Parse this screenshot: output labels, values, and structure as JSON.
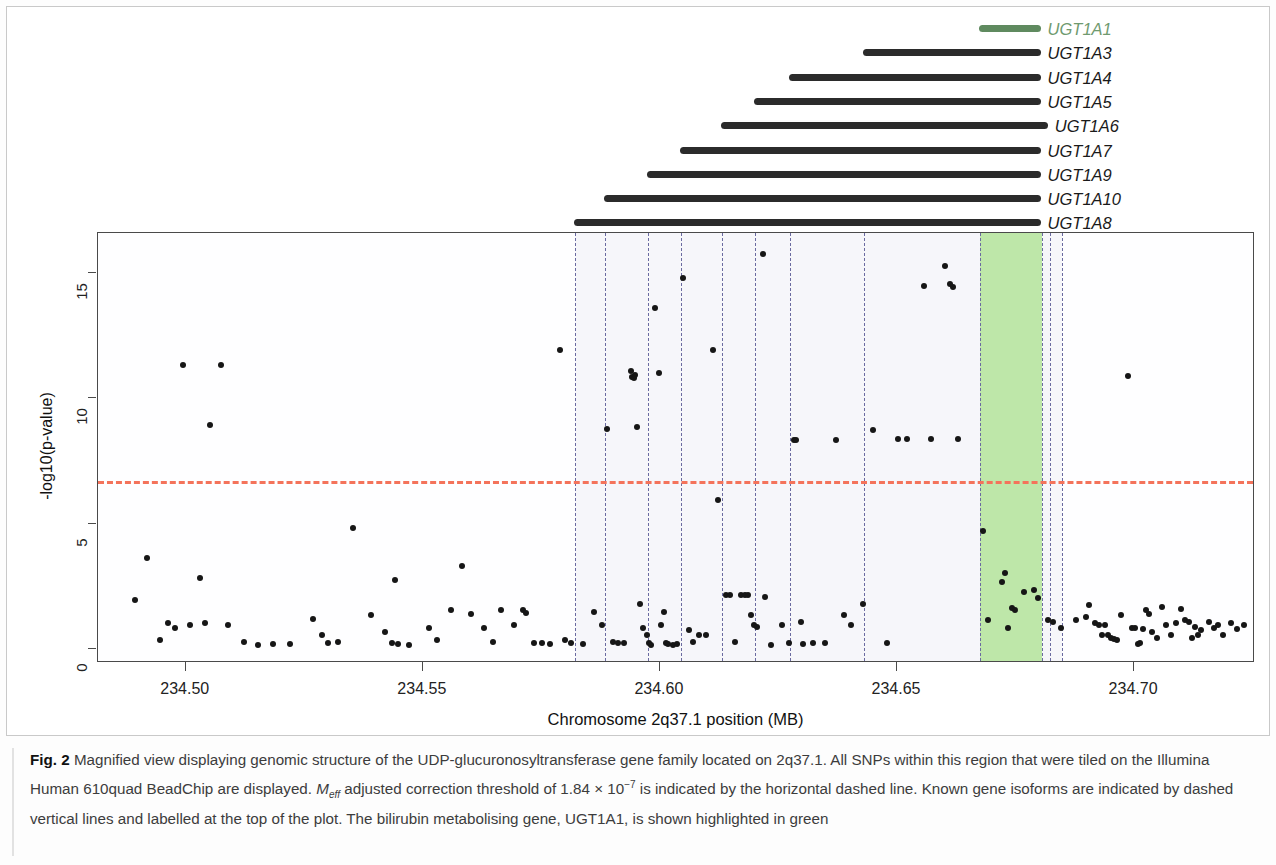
{
  "figure": {
    "label": "Fig. 2",
    "caption_part1": " Magnified view displaying genomic structure of the UDP-glucuronosyltransferase gene family located on 2q37.1. All SNPs within this region that were tiled on the Illumina Human 610quad BeadChip are displayed. ",
    "meff_italic": "M",
    "meff_sub": "eff",
    "caption_part2": " adjusted correction threshold of 1.84 × 10",
    "threshold_exp": "−7",
    "caption_part3": " is indicated by the horizontal dashed line. Known gene isoforms are indicated by dashed vertical lines and labelled at the top of the plot. The bilirubin metabolising gene, UGT1A1, is shown highlighted in green"
  },
  "genes": [
    {
      "name": "UGT1A1",
      "start": 234.6675,
      "end": 234.6805,
      "color": "#5f8a5f",
      "highlight": true
    },
    {
      "name": "UGT1A3",
      "start": 234.643,
      "end": 234.6805,
      "color": "#2b2b2b",
      "highlight": false
    },
    {
      "name": "UGT1A4",
      "start": 234.6275,
      "end": 234.6805,
      "color": "#2b2b2b",
      "highlight": false
    },
    {
      "name": "UGT1A5",
      "start": 234.62,
      "end": 234.6805,
      "color": "#2b2b2b",
      "highlight": false
    },
    {
      "name": "UGT1A6",
      "start": 234.613,
      "end": 234.682,
      "color": "#2b2b2b",
      "highlight": false
    },
    {
      "name": "UGT1A7",
      "start": 234.6045,
      "end": 234.6805,
      "color": "#2b2b2b",
      "highlight": false
    },
    {
      "name": "UGT1A9",
      "start": 234.5975,
      "end": 234.6805,
      "color": "#2b2b2b",
      "highlight": false
    },
    {
      "name": "UGT1A10",
      "start": 234.5885,
      "end": 234.6805,
      "color": "#2b2b2b",
      "highlight": false
    },
    {
      "name": "UGT1A8",
      "start": 234.582,
      "end": 234.6805,
      "color": "#2b2b2b",
      "highlight": false
    }
  ],
  "chart_data": {
    "type": "scatter",
    "title": "",
    "xlabel": "Chromosome 2q37.1 position (MB)",
    "ylabel": "-log10(p-value)",
    "xlim": [
      234.4815,
      234.7255
    ],
    "ylim": [
      -0.55,
      16.6
    ],
    "xticks": [
      234.5,
      234.55,
      234.6,
      234.65,
      234.7
    ],
    "xticklabels": [
      "234.50",
      "234.55",
      "234.60",
      "234.65",
      "234.70"
    ],
    "yticks": [
      0,
      5,
      10,
      15
    ],
    "yticklabels": [
      "0",
      "5",
      "10",
      "15"
    ],
    "grid": false,
    "legend": "none",
    "threshold_line": {
      "y": 6.7,
      "color": "#f4735b",
      "style": "dashed",
      "label": "Meff adjusted correction threshold 1.84e-7"
    },
    "gene_boundary_lines": {
      "color": "#6a6aa0",
      "style": "dashed",
      "x": [
        234.582,
        234.5885,
        234.5975,
        234.6045,
        234.613,
        234.62,
        234.6275,
        234.643,
        234.6675,
        234.6805,
        234.6823,
        234.6848
      ]
    },
    "shaded_region": {
      "x0": 234.582,
      "x1": 234.6848,
      "color": "#f6f6fa"
    },
    "highlight_region": {
      "gene": "UGT1A1",
      "x0": 234.6675,
      "x1": 234.6805,
      "color": "#b4e49a"
    },
    "points": [
      [
        234.4892,
        1.95
      ],
      [
        234.4918,
        3.65
      ],
      [
        234.4945,
        0.35
      ],
      [
        234.4962,
        1.05
      ],
      [
        234.4978,
        0.85
      ],
      [
        234.4995,
        11.35
      ],
      [
        234.5008,
        0.95
      ],
      [
        234.503,
        2.85
      ],
      [
        234.504,
        1.05
      ],
      [
        234.5052,
        8.95
      ],
      [
        234.5075,
        11.35
      ],
      [
        234.509,
        0.95
      ],
      [
        234.5122,
        0.3
      ],
      [
        234.5152,
        0.15
      ],
      [
        234.5185,
        0.2
      ],
      [
        234.522,
        0.2
      ],
      [
        234.5268,
        1.2
      ],
      [
        234.5288,
        0.55
      ],
      [
        234.53,
        0.25
      ],
      [
        234.5322,
        0.3
      ],
      [
        234.5352,
        4.85
      ],
      [
        234.539,
        1.35
      ],
      [
        234.542,
        0.7
      ],
      [
        234.5435,
        0.25
      ],
      [
        234.5442,
        2.75
      ],
      [
        234.5448,
        0.2
      ],
      [
        234.547,
        0.15
      ],
      [
        234.5512,
        0.85
      ],
      [
        234.553,
        0.35
      ],
      [
        234.556,
        1.55
      ],
      [
        234.5582,
        3.3
      ],
      [
        234.5602,
        1.4
      ],
      [
        234.5628,
        0.85
      ],
      [
        234.5648,
        0.3
      ],
      [
        234.5665,
        1.55
      ],
      [
        234.5692,
        0.95
      ],
      [
        234.5712,
        1.55
      ],
      [
        234.5718,
        1.45
      ],
      [
        234.5735,
        0.25
      ],
      [
        234.5752,
        0.25
      ],
      [
        234.5768,
        0.2
      ],
      [
        234.579,
        11.95
      ],
      [
        234.58,
        0.35
      ],
      [
        234.5812,
        0.25
      ],
      [
        234.5838,
        0.2
      ],
      [
        234.5862,
        1.5
      ],
      [
        234.5878,
        0.95
      ],
      [
        234.5888,
        8.8
      ],
      [
        234.5902,
        0.3
      ],
      [
        234.5912,
        0.25
      ],
      [
        234.5925,
        0.25
      ],
      [
        234.5938,
        11.1
      ],
      [
        234.5942,
        10.85
      ],
      [
        234.5945,
        10.8
      ],
      [
        234.5948,
        10.95
      ],
      [
        234.5952,
        8.85
      ],
      [
        234.5958,
        1.8
      ],
      [
        234.5965,
        0.85
      ],
      [
        234.5972,
        0.55
      ],
      [
        234.5978,
        0.25
      ],
      [
        234.5982,
        0.15
      ],
      [
        234.599,
        13.6
      ],
      [
        234.5998,
        11.0
      ],
      [
        234.6002,
        0.95
      ],
      [
        234.6008,
        1.5
      ],
      [
        234.6012,
        0.25
      ],
      [
        234.6018,
        0.2
      ],
      [
        234.6028,
        0.15
      ],
      [
        234.6035,
        0.2
      ],
      [
        234.6048,
        14.8
      ],
      [
        234.6062,
        0.75
      ],
      [
        234.607,
        0.3
      ],
      [
        234.6082,
        0.55
      ],
      [
        234.6098,
        0.55
      ],
      [
        234.6112,
        11.95
      ],
      [
        234.6122,
        5.95
      ],
      [
        234.614,
        2.15
      ],
      [
        234.6148,
        2.15
      ],
      [
        234.6158,
        0.3
      ],
      [
        234.6172,
        2.15
      ],
      [
        234.618,
        2.15
      ],
      [
        234.6185,
        2.15
      ],
      [
        234.6192,
        1.35
      ],
      [
        234.6198,
        0.95
      ],
      [
        234.6205,
        0.9
      ],
      [
        234.6218,
        15.75
      ],
      [
        234.6222,
        2.1
      ],
      [
        234.6235,
        0.15
      ],
      [
        234.6258,
        0.95
      ],
      [
        234.6272,
        0.25
      ],
      [
        234.6282,
        8.35
      ],
      [
        234.6288,
        8.35
      ],
      [
        234.6298,
        1.1
      ],
      [
        234.6302,
        0.2
      ],
      [
        234.6322,
        0.25
      ],
      [
        234.6348,
        0.25
      ],
      [
        234.6372,
        8.35
      ],
      [
        234.6388,
        1.35
      ],
      [
        234.6402,
        0.95
      ],
      [
        234.6428,
        1.8
      ],
      [
        234.645,
        8.75
      ],
      [
        234.6478,
        0.25
      ],
      [
        234.6502,
        8.4
      ],
      [
        234.6522,
        8.4
      ],
      [
        234.6558,
        14.5
      ],
      [
        234.6572,
        8.4
      ],
      [
        234.6602,
        15.3
      ],
      [
        234.6612,
        14.55
      ],
      [
        234.6618,
        14.45
      ],
      [
        234.6628,
        8.4
      ],
      [
        234.6682,
        4.7
      ],
      [
        234.6722,
        2.7
      ],
      [
        234.6728,
        3.05
      ],
      [
        234.6742,
        1.65
      ],
      [
        234.6748,
        1.55
      ],
      [
        234.6692,
        1.15
      ],
      [
        234.6735,
        0.85
      ],
      [
        234.6768,
        2.3
      ],
      [
        234.6788,
        2.35
      ],
      [
        234.6798,
        2.05
      ],
      [
        234.6818,
        1.15
      ],
      [
        234.6828,
        1.1
      ],
      [
        234.6845,
        0.85
      ],
      [
        234.6878,
        1.15
      ],
      [
        234.6898,
        1.3
      ],
      [
        234.6905,
        1.75
      ],
      [
        234.6918,
        1.05
      ],
      [
        234.6925,
        0.95
      ],
      [
        234.6932,
        0.55
      ],
      [
        234.6938,
        0.95
      ],
      [
        234.6945,
        0.55
      ],
      [
        234.6952,
        0.45
      ],
      [
        234.6958,
        0.4
      ],
      [
        234.6965,
        0.35
      ],
      [
        234.6972,
        1.35
      ],
      [
        234.6988,
        10.9
      ],
      [
        234.6995,
        0.85
      ],
      [
        234.7002,
        0.85
      ],
      [
        234.7008,
        0.2
      ],
      [
        234.7012,
        0.25
      ],
      [
        234.7018,
        0.8
      ],
      [
        234.7025,
        1.55
      ],
      [
        234.7032,
        1.4
      ],
      [
        234.7038,
        0.7
      ],
      [
        234.7048,
        0.45
      ],
      [
        234.7058,
        1.7
      ],
      [
        234.7068,
        0.95
      ],
      [
        234.7078,
        0.55
      ],
      [
        234.7088,
        1.05
      ],
      [
        234.7098,
        1.6
      ],
      [
        234.7108,
        1.15
      ],
      [
        234.7115,
        1.1
      ],
      [
        234.7122,
        0.45
      ],
      [
        234.7128,
        0.9
      ],
      [
        234.7135,
        0.55
      ],
      [
        234.7142,
        0.75
      ],
      [
        234.7158,
        1.1
      ],
      [
        234.7168,
        0.85
      ],
      [
        234.7178,
        0.95
      ],
      [
        234.7188,
        0.55
      ],
      [
        234.7205,
        1.05
      ],
      [
        234.7218,
        0.8
      ],
      [
        234.7232,
        0.95
      ]
    ]
  }
}
